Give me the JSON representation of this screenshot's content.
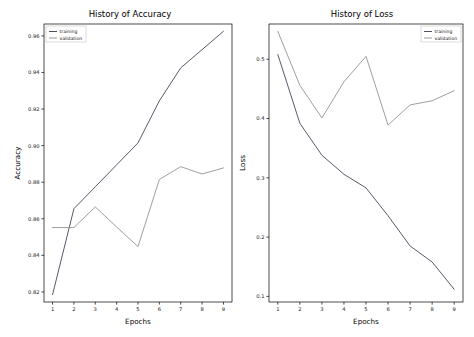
{
  "figure": {
    "background": "#ffffff",
    "panel_count": 2
  },
  "chart_data": [
    {
      "type": "line",
      "id": "history-of-accuracy",
      "title": "History of Accuracy",
      "xlabel": "Epochs",
      "ylabel": "Accuracy",
      "x": [
        1,
        2,
        3,
        4,
        5,
        6,
        7,
        8,
        9
      ],
      "xlim": [
        0.6,
        9.4
      ],
      "ylim": [
        0.8145,
        0.9665
      ],
      "xticks": [
        1,
        2,
        3,
        4,
        5,
        6,
        7,
        8,
        9
      ],
      "xtick_labels": [
        "1",
        "2",
        "3",
        "4",
        "5",
        "6",
        "7",
        "8",
        "9"
      ],
      "yticks": [
        0.82,
        0.84,
        0.86,
        0.88,
        0.9,
        0.92,
        0.94,
        0.96
      ],
      "ytick_labels": [
        "0.82",
        "0.84",
        "0.86",
        "0.88",
        "0.90",
        "0.92",
        "0.94",
        "0.96"
      ],
      "grid": false,
      "legend_position": "upper left",
      "series": [
        {
          "name": "training",
          "color": "#3b3b4f",
          "values": [
            0.8185,
            0.8655,
            0.8775,
            0.8895,
            0.9015,
            0.9245,
            0.9425,
            0.9525,
            0.9625
          ]
        },
        {
          "name": "validation",
          "color": "#8c8c8c",
          "values": [
            0.8552,
            0.8552,
            0.8665,
            0.8555,
            0.8448,
            0.8815,
            0.8885,
            0.8845,
            0.8878
          ]
        }
      ]
    },
    {
      "type": "line",
      "id": "history-of-loss",
      "title": "History of Loss",
      "xlabel": "Epochs",
      "ylabel": "Loss",
      "x": [
        1,
        2,
        3,
        4,
        5,
        6,
        7,
        8,
        9
      ],
      "xlim": [
        0.6,
        9.4
      ],
      "ylim": [
        0.0905,
        0.5595
      ],
      "xticks": [
        1,
        2,
        3,
        4,
        5,
        6,
        7,
        8,
        9
      ],
      "xtick_labels": [
        "1",
        "2",
        "3",
        "4",
        "5",
        "6",
        "7",
        "8",
        "9"
      ],
      "yticks": [
        0.1,
        0.2,
        0.3,
        0.4,
        0.5
      ],
      "ytick_labels": [
        "0.1",
        "0.2",
        "0.3",
        "0.4",
        "0.5"
      ],
      "grid": false,
      "legend_position": "upper right",
      "series": [
        {
          "name": "training",
          "color": "#3b3b4f",
          "values": [
            0.508,
            0.392,
            0.338,
            0.306,
            0.283,
            0.236,
            0.185,
            0.158,
            0.112
          ]
        },
        {
          "name": "validation",
          "color": "#8c8c8c",
          "values": [
            0.547,
            0.456,
            0.401,
            0.462,
            0.505,
            0.389,
            0.423,
            0.43,
            0.447
          ]
        }
      ]
    }
  ]
}
